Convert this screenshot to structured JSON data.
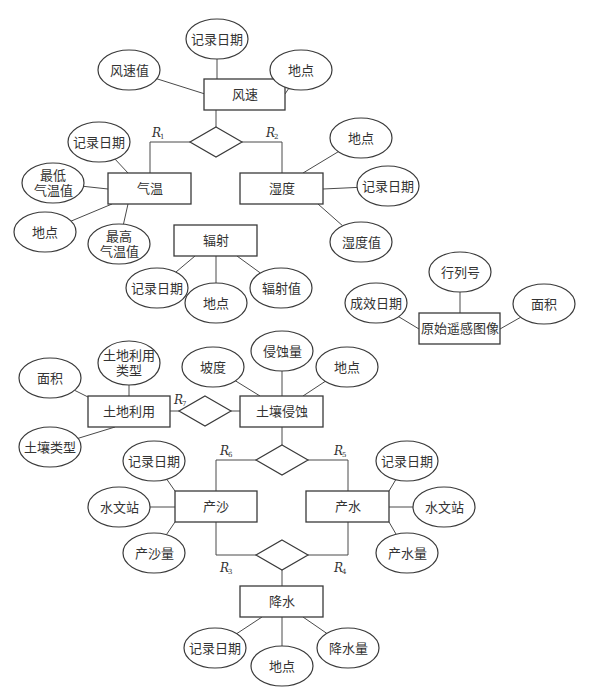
{
  "diagram": {
    "type": "ER diagram",
    "colors": {
      "stroke": "#3a3a3a",
      "text": "#333333",
      "background": "#ffffff"
    },
    "entities": [
      {
        "id": "wind",
        "label": "风速",
        "x": 204,
        "y": 79,
        "w": 81,
        "h": 31
      },
      {
        "id": "temp",
        "label": "气温",
        "x": 108,
        "y": 173,
        "w": 83,
        "h": 31
      },
      {
        "id": "humid",
        "label": "湿度",
        "x": 240,
        "y": 173,
        "w": 83,
        "h": 31
      },
      {
        "id": "radiation",
        "label": "辐射",
        "x": 174,
        "y": 225,
        "w": 83,
        "h": 31
      },
      {
        "id": "rs_image",
        "label": "原始遥感图像",
        "x": 419,
        "y": 313,
        "w": 81,
        "h": 31
      },
      {
        "id": "landuse",
        "label": "土地利用",
        "x": 88,
        "y": 396,
        "w": 82,
        "h": 31
      },
      {
        "id": "erosion",
        "label": "土壤侵蚀",
        "x": 240,
        "y": 396,
        "w": 83,
        "h": 31
      },
      {
        "id": "sediment",
        "label": "产沙",
        "x": 175,
        "y": 491,
        "w": 82,
        "h": 31
      },
      {
        "id": "runoff",
        "label": "产水",
        "x": 306,
        "y": 491,
        "w": 83,
        "h": 31
      },
      {
        "id": "precip",
        "label": "降水",
        "x": 240,
        "y": 586,
        "w": 83,
        "h": 31
      }
    ],
    "attributes": [
      {
        "entity": "wind",
        "label": [
          "记录日期"
        ],
        "cx": 217,
        "cy": 39,
        "rx": 31,
        "ry": 20,
        "ax": 217,
        "ay": 79
      },
      {
        "entity": "wind",
        "label": [
          "风速值"
        ],
        "cx": 129,
        "cy": 70,
        "rx": 31,
        "ry": 20,
        "ax": 205,
        "ay": 94
      },
      {
        "entity": "wind",
        "label": [
          "地点"
        ],
        "cx": 301,
        "cy": 70,
        "rx": 31,
        "ry": 20,
        "ax": 285,
        "ay": 94
      },
      {
        "entity": "temp",
        "label": [
          "记录日期"
        ],
        "cx": 99,
        "cy": 142,
        "rx": 31,
        "ry": 20,
        "ax": 128,
        "ay": 173
      },
      {
        "entity": "temp",
        "label": [
          "最低",
          "气温值"
        ],
        "cx": 53,
        "cy": 183,
        "rx": 31,
        "ry": 20,
        "ax": 108,
        "ay": 189
      },
      {
        "entity": "temp",
        "label": [
          "地点"
        ],
        "cx": 45,
        "cy": 232,
        "rx": 31,
        "ry": 20,
        "ax": 112,
        "ay": 204
      },
      {
        "entity": "temp",
        "label": [
          "最高",
          "气温值"
        ],
        "cx": 119,
        "cy": 244,
        "rx": 31,
        "ry": 20,
        "ax": 128,
        "ay": 204
      },
      {
        "entity": "humid",
        "label": [
          "地点"
        ],
        "cx": 361,
        "cy": 138,
        "rx": 31,
        "ry": 20,
        "ax": 303,
        "ay": 173
      },
      {
        "entity": "humid",
        "label": [
          "记录日期"
        ],
        "cx": 388,
        "cy": 186,
        "rx": 31,
        "ry": 20,
        "ax": 323,
        "ay": 189
      },
      {
        "entity": "humid",
        "label": [
          "湿度值"
        ],
        "cx": 361,
        "cy": 242,
        "rx": 31,
        "ry": 20,
        "ax": 318,
        "ay": 204
      },
      {
        "entity": "radiation",
        "label": [
          "记录日期"
        ],
        "cx": 157,
        "cy": 288,
        "rx": 31,
        "ry": 20,
        "ax": 195,
        "ay": 256
      },
      {
        "entity": "radiation",
        "label": [
          "地点"
        ],
        "cx": 216,
        "cy": 303,
        "rx": 31,
        "ry": 20,
        "ax": 216,
        "ay": 256
      },
      {
        "entity": "radiation",
        "label": [
          "辐射值"
        ],
        "cx": 281,
        "cy": 288,
        "rx": 31,
        "ry": 20,
        "ax": 237,
        "ay": 256
      },
      {
        "entity": "rs_image",
        "label": [
          "行列号"
        ],
        "cx": 460,
        "cy": 272,
        "rx": 31,
        "ry": 20,
        "ax": 460,
        "ay": 313
      },
      {
        "entity": "rs_image",
        "label": [
          "成效日期"
        ],
        "cx": 376,
        "cy": 303,
        "rx": 31,
        "ry": 20,
        "ax": 419,
        "ay": 329
      },
      {
        "entity": "rs_image",
        "label": [
          "面积"
        ],
        "cx": 544,
        "cy": 304,
        "rx": 31,
        "ry": 20,
        "ax": 500,
        "ay": 329
      },
      {
        "entity": "landuse",
        "label": [
          "面积"
        ],
        "cx": 50,
        "cy": 378,
        "rx": 31,
        "ry": 20,
        "ax": 88,
        "ay": 397
      },
      {
        "entity": "landuse",
        "label": [
          "土地利用",
          "类型"
        ],
        "cx": 129,
        "cy": 363,
        "rx": 31,
        "ry": 22,
        "ax": 129,
        "ay": 396
      },
      {
        "entity": "landuse",
        "label": [
          "土壤类型"
        ],
        "cx": 50,
        "cy": 447,
        "rx": 31,
        "ry": 20,
        "ax": 115,
        "ay": 427
      },
      {
        "entity": "erosion",
        "label": [
          "坡度"
        ],
        "cx": 213,
        "cy": 367,
        "rx": 31,
        "ry": 20,
        "ax": 260,
        "ay": 396
      },
      {
        "entity": "erosion",
        "label": [
          "侵蚀量"
        ],
        "cx": 282,
        "cy": 351,
        "rx": 31,
        "ry": 20,
        "ax": 282,
        "ay": 396
      },
      {
        "entity": "erosion",
        "label": [
          "地点"
        ],
        "cx": 347,
        "cy": 367,
        "rx": 31,
        "ry": 20,
        "ax": 303,
        "ay": 396
      },
      {
        "entity": "sediment",
        "label": [
          "记录日期"
        ],
        "cx": 154,
        "cy": 461,
        "rx": 31,
        "ry": 20,
        "ax": 175,
        "ay": 491
      },
      {
        "entity": "sediment",
        "label": [
          "水文站"
        ],
        "cx": 119,
        "cy": 507,
        "rx": 31,
        "ry": 20,
        "ax": 175,
        "ay": 507
      },
      {
        "entity": "sediment",
        "label": [
          "产沙量"
        ],
        "cx": 154,
        "cy": 553,
        "rx": 31,
        "ry": 20,
        "ax": 175,
        "ay": 522
      },
      {
        "entity": "runoff",
        "label": [
          "记录日期"
        ],
        "cx": 407,
        "cy": 461,
        "rx": 31,
        "ry": 20,
        "ax": 389,
        "ay": 491
      },
      {
        "entity": "runoff",
        "label": [
          "水文站"
        ],
        "cx": 444,
        "cy": 507,
        "rx": 31,
        "ry": 20,
        "ax": 389,
        "ay": 507
      },
      {
        "entity": "runoff",
        "label": [
          "产水量"
        ],
        "cx": 407,
        "cy": 553,
        "rx": 31,
        "ry": 20,
        "ax": 389,
        "ay": 522
      },
      {
        "entity": "precip",
        "label": [
          "记录日期"
        ],
        "cx": 215,
        "cy": 648,
        "rx": 31,
        "ry": 20,
        "ax": 262,
        "ay": 617
      },
      {
        "entity": "precip",
        "label": [
          "地点"
        ],
        "cx": 282,
        "cy": 666,
        "rx": 31,
        "ry": 20,
        "ax": 282,
        "ay": 617
      },
      {
        "entity": "precip",
        "label": [
          "降水量"
        ],
        "cx": 348,
        "cy": 648,
        "rx": 31,
        "ry": 20,
        "ax": 303,
        "ay": 617
      }
    ],
    "relationships": [
      {
        "id": "rel_weather",
        "cx": 216,
        "cy": 142,
        "hw": 26,
        "hh": 15,
        "connects": [
          "wind",
          "temp",
          "humid"
        ],
        "lines": [
          [
            216,
            110,
            216,
            127
          ],
          [
            190,
            142,
            150,
            142,
            150,
            173
          ],
          [
            242,
            142,
            282,
            142,
            282,
            173
          ]
        ],
        "labels": [
          {
            "R": "R",
            "sub": "1",
            "x": 152,
            "y": 137
          },
          {
            "R": "R",
            "sub": "2",
            "x": 266,
            "y": 137
          }
        ]
      },
      {
        "id": "rel_land_erosion",
        "cx": 205,
        "cy": 411,
        "hw": 26,
        "hh": 15,
        "connects": [
          "landuse",
          "erosion"
        ],
        "lines": [
          [
            170,
            411,
            179,
            411
          ],
          [
            231,
            411,
            240,
            411
          ]
        ],
        "labels": [
          {
            "R": "R",
            "sub": "7",
            "x": 174,
            "y": 404
          }
        ]
      },
      {
        "id": "rel_erosion_flow",
        "cx": 282,
        "cy": 460,
        "hw": 26,
        "hh": 15,
        "connects": [
          "erosion",
          "sediment",
          "runoff"
        ],
        "lines": [
          [
            282,
            427,
            282,
            445
          ],
          [
            256,
            460,
            216,
            460,
            216,
            491
          ],
          [
            308,
            460,
            348,
            460,
            348,
            491
          ]
        ],
        "labels": [
          {
            "R": "R",
            "sub": "6",
            "x": 220,
            "y": 455
          },
          {
            "R": "R",
            "sub": "5",
            "x": 334,
            "y": 455
          }
        ]
      },
      {
        "id": "rel_flow_precip",
        "cx": 282,
        "cy": 555,
        "hw": 26,
        "hh": 15,
        "connects": [
          "sediment",
          "runoff",
          "precip"
        ],
        "lines": [
          [
            216,
            522,
            216,
            555,
            256,
            555
          ],
          [
            348,
            522,
            348,
            555,
            308,
            555
          ],
          [
            282,
            570,
            282,
            586
          ]
        ],
        "labels": [
          {
            "R": "R",
            "sub": "3",
            "x": 220,
            "y": 572
          },
          {
            "R": "R",
            "sub": "4",
            "x": 334,
            "y": 572
          }
        ]
      }
    ]
  }
}
